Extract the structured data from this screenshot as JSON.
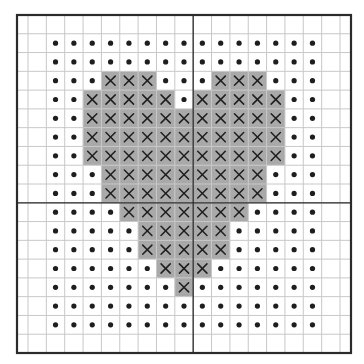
{
  "pattern": {
    "title": "Cross-stitch heart pattern",
    "grid": {
      "columns": 19,
      "rows": 18,
      "center_column_line_after": 10,
      "center_row_line_after": 10
    },
    "legend": {
      "x": "stitched cell (heart)",
      "dot": "background cell"
    },
    "colors": {
      "background": "#ffffff",
      "fill": "#a9a9a9",
      "grid_line": "#c8c8c8",
      "grid_line_on_fill": "#b9b9b9",
      "heavy_line": "#2b2b2b",
      "symbol": "#1e1e1e"
    },
    "rows": [
      "...................",
      "..ooooooooooooooo..",
      "..ooooooooooooooo..",
      "..oooXXXoooXXXooo..",
      "..ooXXXXXoXXXXXoo..",
      "..ooXXXXXXXXXXXoo..",
      "..ooXXXXXXXXXXXoo..",
      "..ooXXXXXXXXXXXoo..",
      "..oooXXXXXXXXXooo..",
      "..oooXXXXXXXXXooo..",
      "..ooooXXXXXXXoooo..",
      "..oooooXXXXXooooo..",
      "..oooooXXXXXooooo..",
      "..ooooooXXXoooooo..",
      "..oooooooXooooooo..",
      "..ooooooooooooooo..",
      "..ooooooooooooooo..",
      "..................."
    ]
  }
}
